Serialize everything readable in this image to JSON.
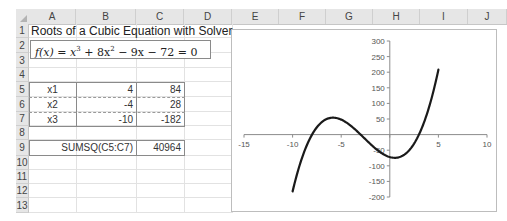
{
  "spreadsheet": {
    "columns": [
      "A",
      "B",
      "C",
      "D",
      "E",
      "F",
      "G",
      "H",
      "I",
      "J"
    ],
    "rows": [
      "1",
      "2",
      "3",
      "4",
      "5",
      "6",
      "7",
      "8",
      "9",
      "10",
      "11",
      "12",
      "13"
    ],
    "title": "Roots of a Cubic Equation with Solver",
    "formula_text": "f(x) = x³ + 8x² − 9x − 72 = 0",
    "formula_parts": {
      "lhs": "f(x) = x",
      "exp1": "3",
      "mid": " + 8x",
      "exp2": "2",
      "rest": " − 9x − 72 = 0"
    },
    "table": [
      {
        "label": "x1",
        "x": "4",
        "fx": "84"
      },
      {
        "label": "x2",
        "x": "-4",
        "fx": "28"
      },
      {
        "label": "x3",
        "x": "-10",
        "fx": "-182"
      }
    ],
    "sumsq_label": "SUMSQ(C5:C7)",
    "sumsq_value": "40964"
  },
  "chart_data": {
    "type": "line",
    "title": "",
    "xlabel": "",
    "ylabel": "",
    "function": "x^3 + 8x^2 - 9x - 72",
    "x_range_plotted": [
      -10,
      5
    ],
    "xlim": [
      -15,
      10
    ],
    "ylim": [
      -200,
      300
    ],
    "x_ticks": [
      "-15",
      "-10",
      "-5",
      "0",
      "5",
      "10"
    ],
    "x_tick_labels": [
      "-15",
      "-10",
      "-5",
      "5",
      "10"
    ],
    "y_ticks": [
      "300",
      "250",
      "200",
      "150",
      "100",
      "50",
      "-50",
      "-100",
      "-150",
      "-200"
    ],
    "grid": false,
    "legend": null,
    "series": [
      {
        "name": "f(x)",
        "x": [
          -10,
          -9,
          -8,
          -7,
          -6,
          -5,
          -4,
          -3,
          -2,
          -1,
          0,
          1,
          2,
          3,
          4,
          5
        ],
        "y": [
          -182,
          -72,
          0,
          40,
          54,
          48,
          28,
          0,
          -30,
          -56,
          -72,
          -72,
          -50,
          0,
          84,
          208
        ]
      }
    ],
    "line_color": "#1a1a1a"
  }
}
